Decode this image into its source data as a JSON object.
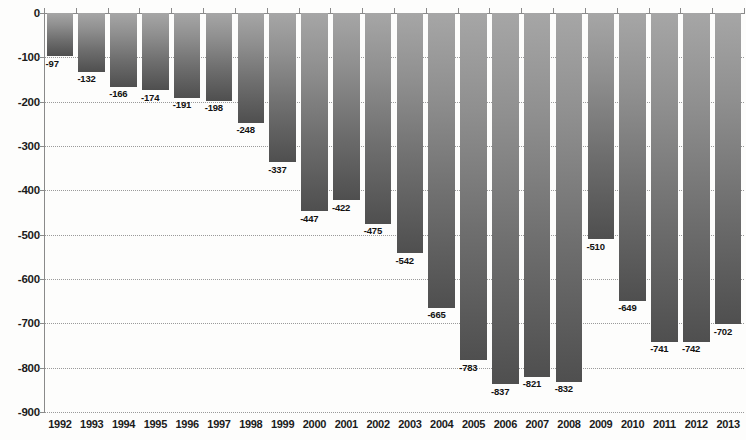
{
  "chart_data": {
    "type": "bar",
    "title": "",
    "subtitle": "",
    "xlabel": "",
    "ylabel": "",
    "ylim": [
      -900,
      0
    ],
    "ytick_step": 100,
    "grid": true,
    "legend": null,
    "orientation": "vertical",
    "bar_direction": "downward",
    "categories": [
      "1992",
      "1993",
      "1994",
      "1995",
      "1996",
      "1997",
      "1998",
      "1999",
      "2000",
      "2001",
      "2002",
      "2003",
      "2004",
      "2005",
      "2006",
      "2007",
      "2008",
      "2009",
      "2010",
      "2011",
      "2012",
      "2013"
    ],
    "values": [
      -97,
      -132,
      -166,
      -174,
      -191,
      -198,
      -248,
      -337,
      -447,
      -422,
      -475,
      -542,
      -665,
      -783,
      -837,
      -821,
      -832,
      -510,
      -649,
      -741,
      -742,
      -702
    ],
    "data_labels": [
      "-97",
      "-132",
      "-166",
      "-174",
      "-191",
      "-198",
      "-248",
      "-337",
      "-447",
      "-422",
      "-475",
      "-542",
      "-665",
      "-783",
      "-837",
      "-821",
      "-832",
      "-510",
      "-649",
      "-741",
      "-742",
      "-702"
    ],
    "yticks": [
      0,
      -100,
      -200,
      -300,
      -400,
      -500,
      -600,
      -700,
      -800,
      -900
    ],
    "ytick_labels": [
      "0",
      "-100",
      "-200",
      "-300",
      "-400",
      "-500",
      "-600",
      "-700",
      "-800",
      "-900"
    ],
    "colors": {
      "bar_top": "#a6a6a6",
      "bar_bottom": "#4f4f4f",
      "grid": "#9a9a9a",
      "axis": "#8a8a8a",
      "text": "#1b1b1b",
      "background": "#fdfdfc"
    }
  }
}
